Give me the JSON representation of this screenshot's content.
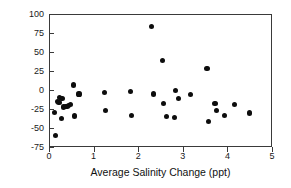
{
  "chart_data": {
    "type": "scatter",
    "title": "",
    "xlabel": "Average Salinity Change (ppt)",
    "ylabel": "Density Change (%)",
    "xlim": [
      0,
      5
    ],
    "ylim": [
      -75,
      100
    ],
    "xticks": [
      0,
      1,
      2,
      3,
      4,
      5
    ],
    "yticks": [
      -75,
      -50,
      -25,
      0,
      25,
      50,
      75,
      100
    ],
    "xtick_labels": [
      "0",
      "1",
      "2",
      "3",
      "4",
      "5"
    ],
    "ytick_labels": [
      "-75",
      "-50",
      "-25",
      "0",
      "25",
      "50",
      "75",
      "100"
    ],
    "grid": false,
    "legend": null,
    "marker": "filled-circle",
    "marker_color": "#0d0d0d",
    "frame_color": "#3a3a3a",
    "series": [
      {
        "name": "observations",
        "points": [
          [
            0.11,
            -28
          ],
          [
            0.13,
            -59
          ],
          [
            0.17,
            -14
          ],
          [
            0.2,
            -15
          ],
          [
            0.22,
            -9
          ],
          [
            0.25,
            -36
          ],
          [
            0.27,
            -10
          ],
          [
            0.3,
            -21
          ],
          [
            0.34,
            -20
          ],
          [
            0.38,
            -20
          ],
          [
            0.42,
            -19
          ],
          [
            0.46,
            -18
          ],
          [
            0.52,
            8
          ],
          [
            0.55,
            -33
          ],
          [
            0.65,
            -4
          ],
          [
            1.23,
            -2
          ],
          [
            1.25,
            -26
          ],
          [
            1.8,
            -1
          ],
          [
            1.83,
            -32
          ],
          [
            2.28,
            85
          ],
          [
            2.32,
            -4
          ],
          [
            2.52,
            40
          ],
          [
            2.55,
            -16
          ],
          [
            2.62,
            -34
          ],
          [
            2.8,
            -35
          ],
          [
            2.82,
            1
          ],
          [
            2.88,
            -10
          ],
          [
            3.15,
            -5
          ],
          [
            3.52,
            30
          ],
          [
            3.55,
            -40
          ],
          [
            3.7,
            -16
          ],
          [
            3.74,
            -26
          ],
          [
            3.92,
            -32
          ],
          [
            4.13,
            -18
          ],
          [
            4.48,
            -29
          ]
        ]
      }
    ]
  }
}
